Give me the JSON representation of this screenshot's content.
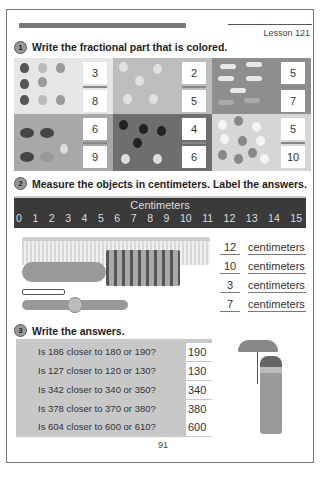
{
  "header": {
    "lesson": "Lesson 121"
  },
  "section1": {
    "number": "1",
    "title": "Write the fractional part that is colored.",
    "items": [
      {
        "fruit": "strawberries",
        "numerator": "3",
        "denominator": "8",
        "bg": "#e6e6e6"
      },
      {
        "fruit": "peaches",
        "numerator": "2",
        "denominator": "5",
        "bg": "#bdbdbd"
      },
      {
        "fruit": "bananas",
        "numerator": "5",
        "denominator": "7",
        "bg": "#8e8e8e"
      },
      {
        "fruit": "cherries",
        "numerator": "6",
        "denominator": "9",
        "bg": "#a8a8a8"
      },
      {
        "fruit": "plums",
        "numerator": "4",
        "denominator": "6",
        "bg": "#6e6e6e"
      },
      {
        "fruit": "lemons",
        "numerator": "5",
        "denominator": "10",
        "bg": "#d6d6d6"
      }
    ]
  },
  "section2": {
    "number": "2",
    "title": "Measure the objects in centimeters.  Label the answers.",
    "ruler": {
      "title": "Centimeters",
      "ticks": [
        "0",
        "1",
        "2",
        "3",
        "4",
        "5",
        "6",
        "7",
        "8",
        "9",
        "10",
        "11",
        "12",
        "13",
        "14",
        "15"
      ]
    },
    "objects": [
      {
        "name": "comb",
        "value": "12",
        "unit": "centimeters"
      },
      {
        "name": "hairbrush",
        "value": "10",
        "unit": "centimeters"
      },
      {
        "name": "bobby-pin",
        "value": "3",
        "unit": "centimeters"
      },
      {
        "name": "barrette",
        "value": "7",
        "unit": "centimeters"
      }
    ]
  },
  "section3": {
    "number": "3",
    "title": "Write the answers.",
    "questions": [
      {
        "q": "Is 186 closer to 180 or 190?",
        "a": "190"
      },
      {
        "q": "Is 127 closer to 120 or 130?",
        "a": "130"
      },
      {
        "q": "Is 342 closer to 340 or 350?",
        "a": "340"
      },
      {
        "q": "Is 378 closer to 370 or 380?",
        "a": "380"
      },
      {
        "q": "Is 604 closer to 600 or 610?",
        "a": "600"
      }
    ]
  },
  "footer": {
    "page_number": "91"
  }
}
